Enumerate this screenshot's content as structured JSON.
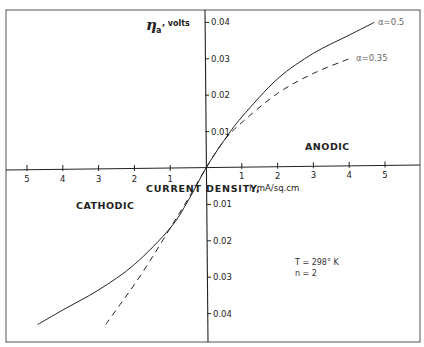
{
  "chart_data": {
    "type": "line",
    "title": "",
    "xlabel": "CURRENT DENSITY,",
    "xlabel_unit": "i, mA/sq.cm",
    "ylabel": {
      "symbol": "η",
      "subscript": "a",
      "unit": ", volts"
    },
    "xlim": [
      -5.5,
      6.0
    ],
    "ylim": [
      -0.045,
      0.044
    ],
    "x_ticks_left": [
      5,
      4,
      3,
      2,
      1
    ],
    "x_ticks_right": [
      1,
      2,
      3,
      4,
      5
    ],
    "x_tick_values_left": [
      -5,
      -4,
      -3,
      -2,
      -1
    ],
    "x_tick_values_right": [
      1,
      2,
      3,
      4,
      5
    ],
    "y_ticks_top": [
      "0.04",
      "0.03",
      "0.02",
      "0.01"
    ],
    "y_tick_values_top": [
      0.04,
      0.03,
      0.02,
      0.01
    ],
    "y_ticks_bottom": [
      "0.01",
      "0.02",
      "0.03",
      "0.04"
    ],
    "y_tick_values_bottom": [
      -0.01,
      -0.02,
      -0.03,
      -0.04
    ],
    "grid": false,
    "region_labels": {
      "anodic": "ANODIC",
      "cathodic": "CATHODIC"
    },
    "annotations": {
      "temperature": "T = 298° K",
      "n": "n = 2"
    },
    "series": [
      {
        "name": "α=0.5",
        "label": "α=0.5",
        "style": "solid",
        "x": [
          -4.7,
          -4.0,
          -3.0,
          -2.0,
          -1.0,
          -0.5,
          0.0,
          0.5,
          1.0,
          2.0,
          3.0,
          4.0,
          4.7
        ],
        "y": [
          -0.043,
          -0.039,
          -0.0335,
          -0.0265,
          -0.0165,
          -0.009,
          0.0,
          0.0075,
          0.014,
          0.0245,
          0.0315,
          0.0365,
          0.04
        ]
      },
      {
        "name": "α=0.35",
        "label": "α=0.35",
        "style": "dashed",
        "x": [
          -2.8,
          -2.4,
          -2.0,
          -1.5,
          -1.0,
          -0.5,
          0.0,
          0.5,
          1.0,
          2.0,
          3.0,
          4.0
        ],
        "y": [
          -0.043,
          -0.0375,
          -0.032,
          -0.0245,
          -0.0165,
          -0.0085,
          0.0,
          0.0075,
          0.0125,
          0.0205,
          0.026,
          0.03
        ]
      }
    ]
  }
}
